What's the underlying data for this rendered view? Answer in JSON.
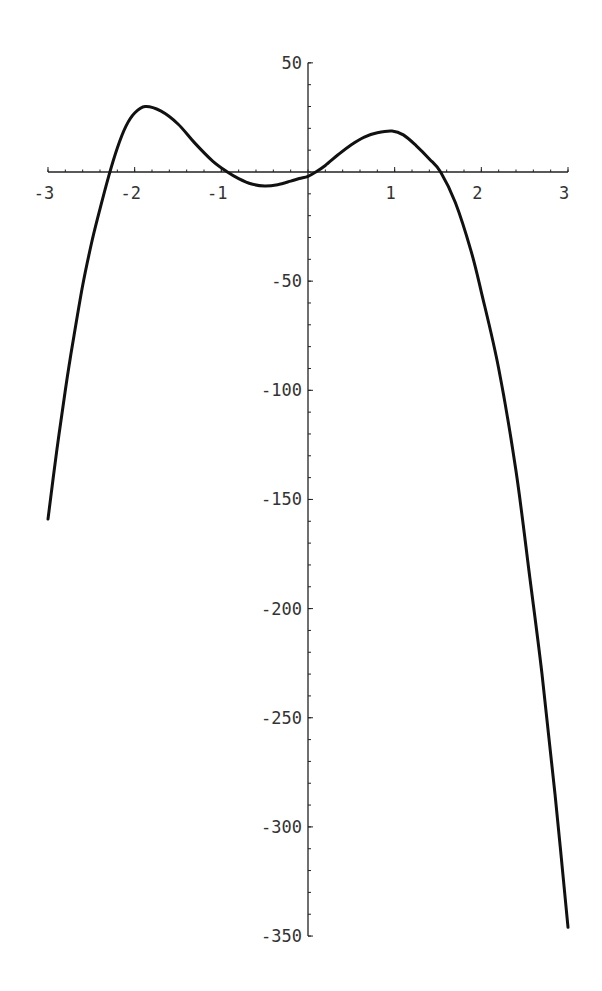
{
  "chart_data": {
    "type": "line",
    "title": "",
    "xlabel": "",
    "ylabel": "",
    "xlim": [
      -3,
      3
    ],
    "ylim": [
      -350,
      50
    ],
    "grid": false,
    "legend": "none",
    "x_ticks": [
      -3,
      -2,
      -1,
      1,
      2,
      3
    ],
    "x_tick_labels": [
      "-3",
      "-2",
      "-1",
      "1",
      "2",
      "3"
    ],
    "x_minor_step": 0.2,
    "y_ticks": [
      50,
      -50,
      -100,
      -150,
      -200,
      -250,
      -300,
      -350
    ],
    "y_tick_labels": [
      "50",
      "-50",
      "-100",
      "-150",
      "-200",
      "-250",
      "-300",
      "-350"
    ],
    "y_minor_step": 10,
    "series": [
      {
        "name": "f(x)",
        "x": [
          -3.0,
          -2.9,
          -2.8,
          -2.75,
          -2.7,
          -2.6,
          -2.5,
          -2.42,
          -2.3,
          -2.2,
          -2.1,
          -2.0,
          -1.88,
          -1.7,
          -1.5,
          -1.3,
          -1.1,
          -0.93,
          -0.8,
          -0.65,
          -0.5,
          -0.35,
          -0.2,
          -0.1,
          0.0,
          0.09,
          0.2,
          0.35,
          0.5,
          0.65,
          0.8,
          0.97,
          1.1,
          1.25,
          1.4,
          1.53,
          1.7,
          1.88,
          2.0,
          2.2,
          2.4,
          2.56,
          2.7,
          2.85,
          3.0
        ],
        "y": [
          -159,
          -128,
          -100,
          -87,
          -75,
          -52,
          -33,
          -20,
          -2,
          11,
          21,
          27,
          30,
          28,
          22,
          13,
          5,
          0,
          -3,
          -5.5,
          -6.4,
          -5.8,
          -4.2,
          -3,
          -2,
          0,
          3,
          8,
          12.5,
          16,
          18,
          18.8,
          17,
          12,
          6,
          0,
          -14,
          -36,
          -55,
          -90,
          -137,
          -186,
          -230,
          -285,
          -346
        ]
      }
    ],
    "key_points": {
      "local_max_left": [
        -1.88,
        30
      ],
      "local_min": [
        -0.5,
        -6.4
      ],
      "local_max_right": [
        0.97,
        18.8
      ],
      "roots": [
        -2.42,
        -0.93,
        0.09,
        1.53
      ]
    }
  }
}
